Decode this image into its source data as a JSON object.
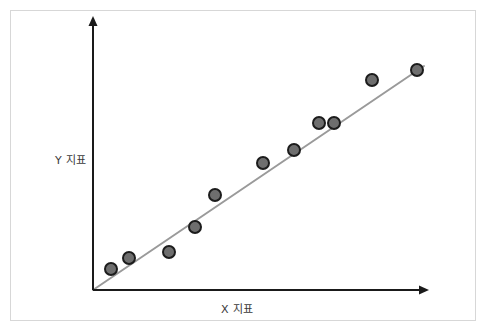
{
  "figure": {
    "width": 487,
    "height": 333,
    "background_color": "#ffffff",
    "border_color": "#d7d7d7"
  },
  "axes": {
    "color": "#1a1a1a",
    "line_width": 2,
    "origin": {
      "x": 93,
      "y": 290
    },
    "x_axis_end": {
      "x": 428,
      "y": 290
    },
    "y_axis_end": {
      "x": 93,
      "y": 18
    },
    "arrowheads": true
  },
  "labels": {
    "x_axis": "X 지표",
    "y_axis": "Y 지표",
    "text_color": "#3a3a3a"
  },
  "chart_data": {
    "type": "scatter",
    "title": "",
    "xlabel": "X 지표",
    "ylabel": "Y 지표",
    "xlim": [
      0,
      100
    ],
    "ylim": [
      0,
      100
    ],
    "grid": false,
    "legend": "none",
    "marker": {
      "shape": "circle",
      "diameter_px": 14,
      "fill_color": "#6e6e6e",
      "edge_color": "#1c1c1c",
      "edge_width_px": 2
    },
    "trendline": {
      "visible": true,
      "color": "#9a9a9a",
      "width_px": 2,
      "start": {
        "x": 0,
        "y": 0
      },
      "end": {
        "x": 99,
        "y": 82
      }
    },
    "points": [
      {
        "x": 5,
        "y": 8,
        "px": 111,
        "py": 269
      },
      {
        "x": 11,
        "y": 12,
        "px": 129,
        "py": 258
      },
      {
        "x": 23,
        "y": 14,
        "px": 169,
        "py": 252
      },
      {
        "x": 31,
        "y": 23,
        "px": 195,
        "py": 227
      },
      {
        "x": 37,
        "y": 35,
        "px": 215,
        "py": 195
      },
      {
        "x": 51,
        "y": 47,
        "px": 263,
        "py": 163
      },
      {
        "x": 60,
        "y": 51,
        "px": 294,
        "py": 150
      },
      {
        "x": 68,
        "y": 61,
        "px": 319,
        "py": 123
      },
      {
        "x": 72,
        "y": 61,
        "px": 334,
        "py": 123
      },
      {
        "x": 83,
        "y": 77,
        "px": 372,
        "py": 80
      },
      {
        "x": 97,
        "y": 81,
        "px": 417,
        "py": 70
      }
    ],
    "series": [
      {
        "name": "관측값",
        "values": [
          8,
          12,
          14,
          23,
          35,
          47,
          51,
          61,
          61,
          77,
          81
        ],
        "x": [
          5,
          11,
          23,
          31,
          37,
          51,
          60,
          68,
          72,
          83,
          97
        ]
      }
    ]
  }
}
